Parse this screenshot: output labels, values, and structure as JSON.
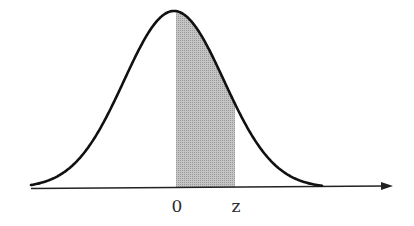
{
  "figure": {
    "axis": {
      "x_start": 31,
      "x_end": 393,
      "y": 187,
      "arrow": "right"
    },
    "curve": {
      "mean_px": 174,
      "sigma_px": 50,
      "peak_y": 11,
      "baseline_y": 188,
      "x_min": 31,
      "x_max": 322
    },
    "shaded_region": {
      "from_px": 176,
      "to_px": 235,
      "fill": "#b8b8b8"
    },
    "labels": [
      {
        "text": "0",
        "x": 177,
        "y": 212
      },
      {
        "text": "z",
        "x": 236,
        "y": 212
      }
    ],
    "colors": {
      "curve": "#111111",
      "axis": "#222222",
      "shade": "#b8b8b8"
    }
  }
}
